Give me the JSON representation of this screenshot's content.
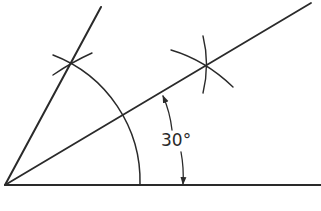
{
  "diagram": {
    "angle_label": "30°",
    "stroke_color": "#2a2a2a",
    "background": "#ffffff",
    "elements": {
      "vertex": {
        "x": 5,
        "y": 185
      },
      "baseline": {
        "from": [
          5,
          185
        ],
        "to": [
          321,
          185
        ]
      },
      "line_60deg": {
        "from": [
          5,
          185
        ],
        "to": [
          101,
          7
        ]
      },
      "bisector_30deg": {
        "from": [
          5,
          185
        ],
        "to": [
          311,
          3
        ]
      },
      "main_arc": {
        "center": [
          5,
          185
        ],
        "radius": 135
      },
      "arc_intersection_60": [
        70,
        62
      ],
      "bisector_construction_point": [
        205,
        65
      ],
      "dimension_arc": {
        "center": [
          5,
          185
        ],
        "radius": 178
      }
    }
  }
}
